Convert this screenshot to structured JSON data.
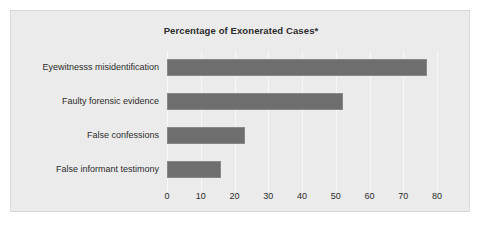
{
  "chart_data": {
    "type": "bar",
    "orientation": "horizontal",
    "title": "Percentage of Exonerated Cases*",
    "xlabel": "",
    "ylabel": "",
    "categories": [
      "Eyewitnesss misidentification",
      "Faulty forensic evidence",
      "False confessions",
      "False informant testimony"
    ],
    "values": [
      77,
      52,
      23,
      16
    ],
    "xlim": [
      0,
      80
    ],
    "xticks": [
      0,
      10,
      20,
      30,
      40,
      50,
      60,
      70,
      80
    ],
    "xtick_labels": [
      "0",
      "10",
      "20",
      "30",
      "40",
      "50",
      "60",
      "70",
      "80"
    ],
    "grid": true,
    "legend": "none",
    "colors": {
      "bar_fill": "#6e6e6e",
      "bar_border": "#888888",
      "panel_background": "#ebebeb",
      "panel_border": "#d8d8d8",
      "gridline": "#f7f7f7",
      "text": "#2b2b2b",
      "figure_background": "#ffffff"
    }
  }
}
